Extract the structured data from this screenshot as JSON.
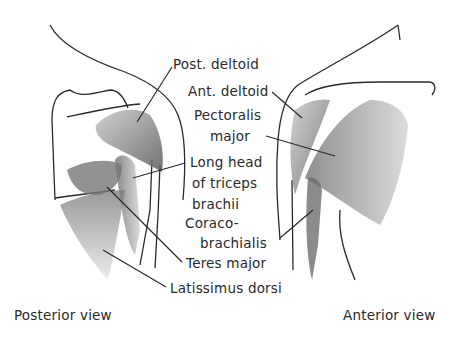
{
  "diagram": {
    "type": "anatomical illustration",
    "views": [
      {
        "id": "posterior",
        "caption": "Posterior view"
      },
      {
        "id": "anterior",
        "caption": "Anterior view"
      }
    ],
    "labels": {
      "post_deltoid": "Post. deltoid",
      "ant_deltoid": "Ant. deltoid",
      "pectoralis_1": "Pectoralis",
      "pectoralis_2": "major",
      "long_head_1": "Long head",
      "long_head_2": "of triceps",
      "long_head_3": "brachii",
      "coraco_1": "Coraco-",
      "coraco_2": "brachialis",
      "teres_major": "Teres major",
      "latissimus": "Latissimus dorsi"
    },
    "colors": {
      "line": "#2a2a2a",
      "muscle_dark": "#555555",
      "muscle_light": "#a8a8a8",
      "background": "#ffffff"
    }
  }
}
